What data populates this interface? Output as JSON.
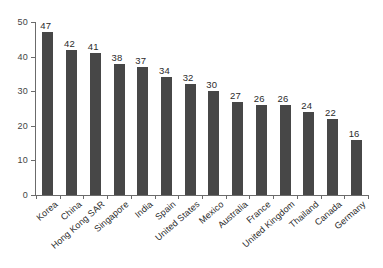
{
  "chart_data": {
    "type": "bar",
    "title": "",
    "subtitle": "",
    "xlabel": "",
    "ylabel": "",
    "ylim": [
      0,
      50
    ],
    "yticks": [
      0,
      10,
      20,
      30,
      40,
      50
    ],
    "ytick_labels": [
      "0",
      "10",
      "20",
      "30",
      "40",
      "50"
    ],
    "grid": false,
    "legend": false,
    "legend_position": "none",
    "bar_color": "#474747",
    "axis_color": "#6b6b6b",
    "background_color": "#ffffff",
    "label_rotation_deg": -41,
    "show_value_labels": true,
    "categories": [
      "Korea",
      "China",
      "Hong Kong SAR",
      "Singapore",
      "India",
      "Spain",
      "United States",
      "Mexico",
      "Australia",
      "France",
      "United Kingdom",
      "Thailand",
      "Canada",
      "Germany"
    ],
    "values": [
      47,
      42,
      41,
      38,
      37,
      34,
      32,
      30,
      27,
      26,
      26,
      24,
      22,
      16
    ],
    "value_labels": [
      "47",
      "42",
      "41",
      "38",
      "37",
      "34",
      "32",
      "30",
      "27",
      "26",
      "26",
      "24",
      "22",
      "16"
    ]
  }
}
